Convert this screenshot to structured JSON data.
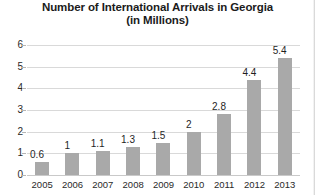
{
  "chart_data": {
    "type": "bar",
    "title": "Number of International Arrivals in Georgia",
    "subtitle": "(in Millions)",
    "xlabel": "",
    "ylabel": "",
    "categories": [
      "2005",
      "2006",
      "2007",
      "2008",
      "2009",
      "2010",
      "2011",
      "2012",
      "2013"
    ],
    "values": [
      0.6,
      1,
      1.1,
      1.3,
      1.5,
      2,
      2.8,
      4.4,
      5.4
    ],
    "value_labels": [
      "0.6",
      "1",
      "1.1",
      "1.3",
      "1.5",
      "2",
      "2.8",
      "4.4",
      "5.4"
    ],
    "ylim": [
      0,
      6
    ],
    "yticks": [
      0,
      1,
      2,
      3,
      4,
      5,
      6
    ],
    "ytick_labels": [
      "0",
      "1",
      "2",
      "3",
      "4",
      "5",
      "6"
    ],
    "grid": true,
    "legend": false,
    "bar_color": "#a9a9a9",
    "gridline_color": "#d9d9d9",
    "text_color": "#1f1f1f",
    "background_color": "#ffffff"
  }
}
